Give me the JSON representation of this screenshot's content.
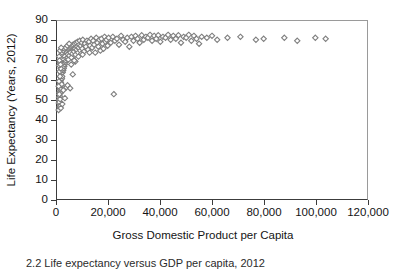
{
  "figure": {
    "width": 406,
    "height": 269,
    "background": "#ffffff",
    "marker_color": "#7f7f7f",
    "axis_color": "#3c3c3c"
  },
  "caption": {
    "text": "2.2 Life expectancy versus GDP per capita, 2012"
  },
  "chart_data": {
    "type": "scatter",
    "title": "",
    "xlabel": "Gross Domestic Product per Capita",
    "ylabel": "Life Expectancy (Years, 2012)",
    "xlim": [
      0,
      120000
    ],
    "ylim": [
      0,
      90
    ],
    "grid": false,
    "legend": null,
    "marker": "open-diamond",
    "marker_color": "#7f7f7f",
    "xticks": [
      0,
      20000,
      40000,
      60000,
      80000,
      100000,
      120000
    ],
    "xticklabels": [
      "0",
      "20,000",
      "40,000",
      "60,000",
      "80,000",
      "100,000",
      "120,000"
    ],
    "yticks": [
      0,
      10,
      20,
      30,
      40,
      50,
      60,
      70,
      80,
      90
    ],
    "yticklabels": [
      "0",
      "10",
      "20",
      "30",
      "40",
      "50",
      "60",
      "70",
      "80",
      "90"
    ],
    "points": [
      [
        620,
        45.0
      ],
      [
        700,
        48.5
      ],
      [
        780,
        50.2
      ],
      [
        840,
        51.5
      ],
      [
        900,
        49.0
      ],
      [
        950,
        54.0
      ],
      [
        1000,
        46.5
      ],
      [
        1050,
        55.5
      ],
      [
        1100,
        52.0
      ],
      [
        1150,
        57.0
      ],
      [
        1200,
        50.5
      ],
      [
        1250,
        58.5
      ],
      [
        1300,
        53.5
      ],
      [
        1350,
        60.0
      ],
      [
        1400,
        56.0
      ],
      [
        1450,
        61.5
      ],
      [
        1500,
        59.0
      ],
      [
        1550,
        62.5
      ],
      [
        1600,
        57.5
      ],
      [
        1650,
        63.5
      ],
      [
        1700,
        60.5
      ],
      [
        1750,
        64.5
      ],
      [
        1800,
        58.0
      ],
      [
        1850,
        65.5
      ],
      [
        1900,
        61.0
      ],
      [
        1950,
        66.5
      ],
      [
        2000,
        62.0
      ],
      [
        2100,
        67.5
      ],
      [
        2200,
        64.0
      ],
      [
        2300,
        68.5
      ],
      [
        2400,
        65.0
      ],
      [
        2500,
        69.5
      ],
      [
        2600,
        66.0
      ],
      [
        2700,
        70.5
      ],
      [
        2800,
        67.0
      ],
      [
        2900,
        71.5
      ],
      [
        3000,
        68.0
      ],
      [
        3100,
        72.0
      ],
      [
        3200,
        69.0
      ],
      [
        3300,
        73.0
      ],
      [
        3400,
        70.0
      ],
      [
        3500,
        74.0
      ],
      [
        3600,
        71.0
      ],
      [
        3700,
        74.5
      ],
      [
        3800,
        72.0
      ],
      [
        3900,
        75.0
      ],
      [
        4000,
        73.0
      ],
      [
        4200,
        75.5
      ],
      [
        4400,
        70.5
      ],
      [
        4600,
        76.0
      ],
      [
        4800,
        72.5
      ],
      [
        5000,
        76.5
      ],
      [
        5200,
        74.0
      ],
      [
        5400,
        77.0
      ],
      [
        5600,
        71.5
      ],
      [
        5800,
        77.5
      ],
      [
        6000,
        73.5
      ],
      [
        6200,
        78.0
      ],
      [
        6400,
        75.0
      ],
      [
        6600,
        74.5
      ],
      [
        6800,
        78.5
      ],
      [
        7000,
        76.0
      ],
      [
        7200,
        73.0
      ],
      [
        7400,
        79.0
      ],
      [
        7600,
        75.5
      ],
      [
        7800,
        77.0
      ],
      [
        8000,
        79.5
      ],
      [
        8200,
        74.0
      ],
      [
        8400,
        76.5
      ],
      [
        8600,
        78.0
      ],
      [
        8800,
        80.0
      ],
      [
        9000,
        75.0
      ],
      [
        9200,
        77.5
      ],
      [
        9400,
        73.5
      ],
      [
        9600,
        79.0
      ],
      [
        9800,
        76.0
      ],
      [
        10000,
        80.5
      ],
      [
        10400,
        74.5
      ],
      [
        10800,
        78.5
      ],
      [
        11200,
        77.0
      ],
      [
        11600,
        80.0
      ],
      [
        12000,
        75.5
      ],
      [
        12400,
        79.5
      ],
      [
        12800,
        77.5
      ],
      [
        13200,
        81.0
      ],
      [
        13600,
        76.5
      ],
      [
        14000,
        80.0
      ],
      [
        14400,
        78.0
      ],
      [
        14800,
        74.0
      ],
      [
        15200,
        81.5
      ],
      [
        15600,
        79.0
      ],
      [
        16000,
        77.0
      ],
      [
        16400,
        80.5
      ],
      [
        16800,
        75.0
      ],
      [
        17200,
        81.0
      ],
      [
        17600,
        78.5
      ],
      [
        18000,
        76.0
      ],
      [
        18400,
        82.0
      ],
      [
        18800,
        79.5
      ],
      [
        19200,
        80.5
      ],
      [
        19600,
        77.5
      ],
      [
        20000,
        81.5
      ],
      [
        20800,
        79.0
      ],
      [
        21600,
        82.0
      ],
      [
        22000,
        53.0
      ],
      [
        22400,
        80.0
      ],
      [
        23200,
        81.0
      ],
      [
        24000,
        78.0
      ],
      [
        24800,
        82.5
      ],
      [
        25600,
        80.5
      ],
      [
        26400,
        79.5
      ],
      [
        27200,
        81.5
      ],
      [
        28000,
        77.0
      ],
      [
        28800,
        82.0
      ],
      [
        29600,
        80.0
      ],
      [
        30400,
        82.5
      ],
      [
        31200,
        81.0
      ],
      [
        32000,
        79.0
      ],
      [
        32800,
        82.8
      ],
      [
        33600,
        80.5
      ],
      [
        34400,
        82.0
      ],
      [
        35200,
        81.5
      ],
      [
        36000,
        83.0
      ],
      [
        36800,
        80.0
      ],
      [
        37600,
        82.5
      ],
      [
        38400,
        81.0
      ],
      [
        39200,
        82.8
      ],
      [
        40000,
        79.5
      ],
      [
        41000,
        82.0
      ],
      [
        42000,
        81.5
      ],
      [
        43000,
        83.0
      ],
      [
        44000,
        80.5
      ],
      [
        45000,
        82.5
      ],
      [
        46000,
        81.0
      ],
      [
        47000,
        82.8
      ],
      [
        48000,
        79.0
      ],
      [
        49000,
        82.0
      ],
      [
        50000,
        81.5
      ],
      [
        51000,
        83.0
      ],
      [
        52000,
        80.0
      ],
      [
        53000,
        82.5
      ],
      [
        54000,
        81.0
      ],
      [
        55000,
        78.5
      ],
      [
        56000,
        82.0
      ],
      [
        58000,
        81.5
      ],
      [
        60000,
        82.5
      ],
      [
        62000,
        80.5
      ],
      [
        66000,
        81.5
      ],
      [
        71000,
        82.0
      ],
      [
        77000,
        80.5
      ],
      [
        80000,
        81.0
      ],
      [
        88000,
        81.5
      ],
      [
        93000,
        80.0
      ],
      [
        100000,
        81.5
      ],
      [
        104000,
        81.0
      ],
      [
        1250,
        47.0
      ],
      [
        1500,
        46.0
      ],
      [
        2050,
        48.0
      ],
      [
        3050,
        51.0
      ],
      [
        3600,
        56.5
      ],
      [
        4100,
        57.5
      ],
      [
        5100,
        56.0
      ],
      [
        6100,
        63.0
      ],
      [
        7100,
        69.5
      ],
      [
        2450,
        55.0
      ],
      [
        900,
        53.0
      ],
      [
        1150,
        62.0
      ],
      [
        760,
        59.5
      ],
      [
        640,
        57.0
      ],
      [
        1020,
        64.5
      ],
      [
        1420,
        66.0
      ],
      [
        1820,
        68.5
      ],
      [
        2220,
        71.0
      ],
      [
        2620,
        72.5
      ],
      [
        3020,
        74.5
      ],
      [
        800,
        67.5
      ],
      [
        1100,
        69.0
      ],
      [
        1350,
        71.5
      ],
      [
        1700,
        73.0
      ],
      [
        2000,
        74.0
      ],
      [
        2400,
        75.0
      ],
      [
        2900,
        76.0
      ],
      [
        3400,
        76.5
      ],
      [
        4000,
        77.5
      ],
      [
        4700,
        78.5
      ],
      [
        820,
        72.0
      ],
      [
        980,
        70.0
      ],
      [
        1180,
        75.0
      ],
      [
        1380,
        68.0
      ],
      [
        1620,
        76.5
      ],
      [
        5500,
        68.0
      ],
      [
        6700,
        70.0
      ],
      [
        8300,
        72.0
      ],
      [
        9900,
        73.0
      ],
      [
        12600,
        74.0
      ]
    ]
  }
}
